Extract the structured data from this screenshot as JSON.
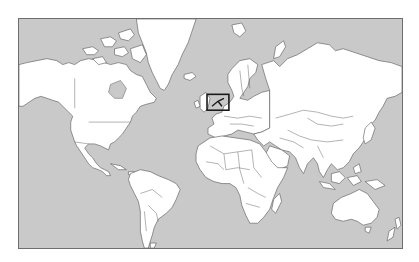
{
  "map": {
    "projection": "mercator",
    "type": "world political outline map",
    "colors": {
      "ocean": "#c9c9c9",
      "land": "#ffffff",
      "borders": "#555555",
      "frame": "#6e6e6e",
      "highlight": "#1a1a1a"
    },
    "highlight": {
      "region": "western-europe-france",
      "shape": "rectangle"
    },
    "continents": [
      "north-america",
      "greenland",
      "south-america",
      "europe",
      "africa",
      "asia",
      "australia",
      "new-zealand"
    ]
  }
}
